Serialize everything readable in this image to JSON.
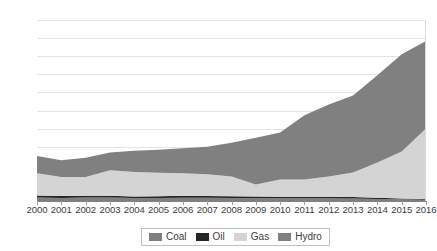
{
  "chart_data": {
    "type": "area",
    "stacked": true,
    "title": "",
    "subtitle": "",
    "xlabel": "",
    "ylabel": "",
    "grid": true,
    "legend_position": "bottom",
    "xlim": [
      2000,
      2016
    ],
    "ylim": [
      0,
      20000
    ],
    "y_tick_step": 2000,
    "categories": [
      2000,
      2001,
      2002,
      2003,
      2004,
      2005,
      2006,
      2007,
      2008,
      2009,
      2010,
      2011,
      2012,
      2013,
      2014,
      2015,
      2016
    ],
    "x_tick_labels": [
      "2000",
      "2001",
      "2002",
      "2003",
      "2004",
      "2005",
      "2006",
      "2007",
      "2008",
      "2009",
      "2010",
      "2011",
      "2012",
      "2013",
      "2014",
      "2015",
      "2016"
    ],
    "y_tick_labels": [
      "0",
      "2000",
      "4000",
      "6000",
      "8000",
      "10000",
      "12000",
      "14000",
      "16000",
      "18000",
      "20000"
    ],
    "series": [
      {
        "name": "Coal",
        "color": "#7f7f7f",
        "values": [
          380,
          330,
          400,
          390,
          330,
          330,
          350,
          350,
          330,
          320,
          300,
          300,
          300,
          290,
          230,
          180,
          150
        ]
      },
      {
        "name": "Oil",
        "color": "#262626",
        "values": [
          240,
          220,
          190,
          200,
          180,
          200,
          230,
          210,
          190,
          180,
          180,
          180,
          170,
          160,
          120,
          90,
          70
        ]
      },
      {
        "name": "Gas",
        "color": "#d4d4d4",
        "values": [
          2450,
          2100,
          2050,
          2800,
          2700,
          2600,
          2500,
          2400,
          2200,
          1320,
          1900,
          1900,
          2250,
          2700,
          3900,
          5200,
          7800
        ]
      },
      {
        "name": "Hydro",
        "color": "#808080",
        "values": [
          1910,
          1840,
          2150,
          1980,
          2350,
          2520,
          2740,
          3040,
          3710,
          5180,
          5200,
          7100,
          7950,
          8500,
          9650,
          10750,
          9650
        ]
      }
    ],
    "series_totals": [
      4980,
      4490,
      4790,
      5370,
      5560,
      5650,
      5820,
      6000,
      6430,
      7000,
      7580,
      9480,
      10670,
      11650,
      13900,
      16220,
      17670
    ]
  },
  "legend": {
    "items": [
      {
        "label": "Coal",
        "color": "#7f7f7f"
      },
      {
        "label": "Oil",
        "color": "#262626"
      },
      {
        "label": "Gas",
        "color": "#d4d4d4"
      },
      {
        "label": "Hydro",
        "color": "#808080"
      }
    ]
  },
  "style": {
    "background": "#ffffff",
    "gridline_color": "#e4e4e4",
    "axis_color": "#808080",
    "tick_color": "#9a9a9a",
    "text_color": "#3c3c3c",
    "legend_border": "#bfbfbf"
  }
}
